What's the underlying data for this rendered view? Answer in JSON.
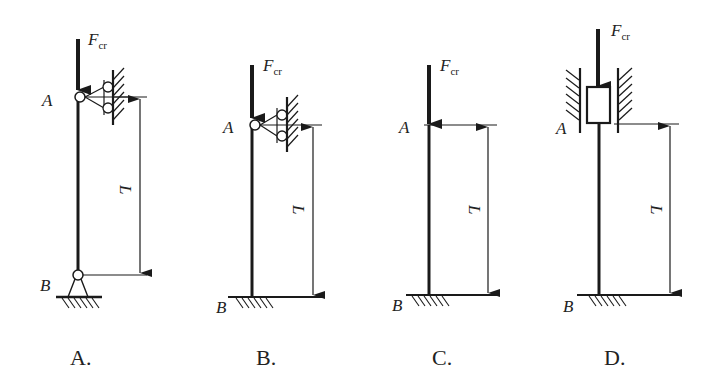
{
  "figure": {
    "force_symbol": "F",
    "force_subscript": "cr",
    "length_label": "L",
    "point_top": "A",
    "point_bottom": "B"
  },
  "options": [
    {
      "label": "A.",
      "top_support": "pin with roller against wall",
      "bottom_support": "pin"
    },
    {
      "label": "B.",
      "top_support": "pin with roller against wall",
      "bottom_support": "fixed"
    },
    {
      "label": "C.",
      "top_support": "free",
      "bottom_support": "fixed"
    },
    {
      "label": "D.",
      "top_support": "sliding guide (rotation fixed)",
      "bottom_support": "fixed"
    }
  ],
  "colors": {
    "line": "#1a1a1a",
    "background": "#ffffff"
  }
}
